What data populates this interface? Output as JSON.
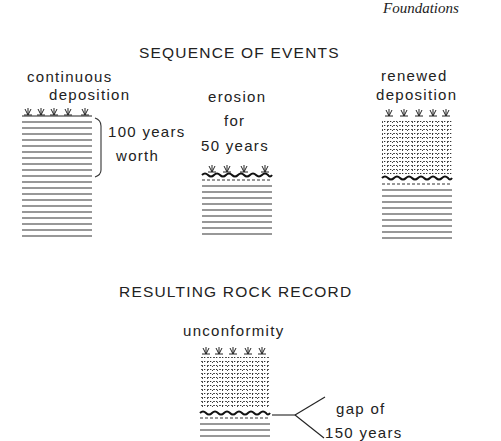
{
  "header": {
    "running_title": "Foundations"
  },
  "sequence": {
    "title": "SEQUENCE OF EVENTS",
    "stages": [
      {
        "label_lines": [
          "continuous",
          "deposition"
        ],
        "annotation_lines": [
          "100 years",
          "worth"
        ]
      },
      {
        "label_lines": [
          "erosion",
          "for",
          "50 years"
        ]
      },
      {
        "label_lines": [
          "renewed",
          "deposition"
        ]
      }
    ]
  },
  "result": {
    "title": "RESULTING ROCK RECORD",
    "column_label": "unconformity",
    "gap_annotation_lines": [
      "gap of",
      "150 years"
    ]
  },
  "icons": {
    "plant": "grass-tuft-icon",
    "strata": "sediment-layers",
    "erosion": "erosion-surface",
    "new_sediment": "dotted-sediment"
  }
}
